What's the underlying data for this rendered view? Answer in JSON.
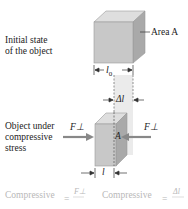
{
  "diagram": {
    "initial_state": {
      "label_line1": "Initial state",
      "label_line2": "of the object",
      "area_label": "Area A",
      "length_label": "l0"
    },
    "compressed_state": {
      "label_line1": "Object under",
      "label_line2": "compressive",
      "label_line3": "stress",
      "force_left": "F⊥",
      "force_right": "F⊥",
      "area_label": "A",
      "delta_label": "Δl",
      "length_label": "l"
    },
    "formulas": {
      "stress_word": "Compressive",
      "stress_numerator": "F⊥",
      "strain_word": "Compressive",
      "strain_numerator": "Δl"
    },
    "colors": {
      "block_front": "#c8c8c8",
      "block_top": "#dedede",
      "block_side": "#a9a9a9",
      "arrow": "#888888",
      "faded_text": "#b8b8b8"
    }
  }
}
